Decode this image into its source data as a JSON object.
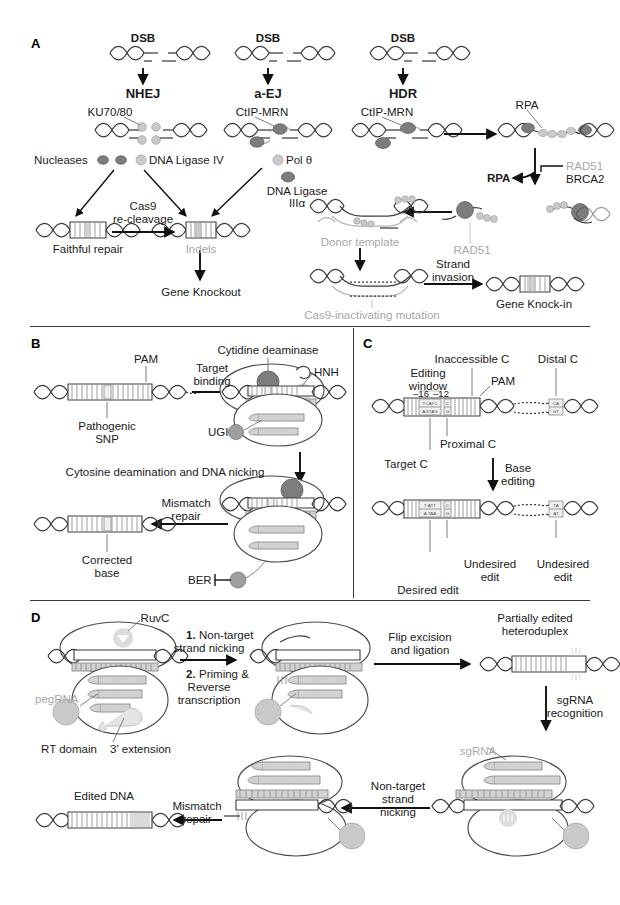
{
  "figure": {
    "type": "scientific-diagram"
  },
  "panels": [
    {
      "id": "A",
      "letter": "A",
      "title": "DNA double-strand break repair pathways",
      "labels": {
        "dsb_nhej": "DSB",
        "dsb_aej": "DSB",
        "dsb_hdr": "DSB",
        "nhej": "NHEJ",
        "aej": "a-EJ",
        "hdr": "HDR",
        "ku7080": "KU70/80",
        "ctip_mrn_aej": "CtIP-MRN",
        "ctip_mrn_hdr": "CtIP-MRN",
        "nucleases": "Nucleases",
        "dna_ligase_iv": "DNA Ligase IV",
        "pol_theta": "Pol θ",
        "dna_ligase_iii_l1": "DNA Ligase",
        "dna_ligase_iii_l2": "IIIα",
        "cas9_recleavage_l1": "Cas9",
        "cas9_recleavage_l2": "re-cleavage",
        "faithful_repair": "Faithful repair",
        "indels": "Indels",
        "gene_knockout": "Gene Knockout",
        "rpa_top": "RPA",
        "rpa_left": "RPA",
        "rad51_top": "RAD51",
        "brca2": "BRCA2",
        "rad51_bottom": "RAD51",
        "donor_template": "Donor template",
        "strand_invasion_l1": "Strand",
        "strand_invasion_l2": "invasion",
        "gene_knock_in": "Gene Knock-in",
        "cas9_inactivating": "Cas9-inactivating mutation"
      }
    },
    {
      "id": "B",
      "letter": "B",
      "title": "Cytosine base editing",
      "labels": {
        "pam": "PAM",
        "pathogenic_l1": "Pathogenic",
        "pathogenic_l2": "SNP",
        "target_binding_l1": "Target",
        "target_binding_l2": "binding",
        "cytidine_deaminase": "Cytidine deaminase",
        "hnh": "HNH",
        "ugi": "UGI",
        "deamination": "Cytosine deamination and DNA nicking",
        "mismatch_repair_l1": "Mismatch",
        "mismatch_repair_l2": "repair",
        "corrected_l1": "Corrected",
        "corrected_l2": "base",
        "ber": "BER"
      }
    },
    {
      "id": "C",
      "letter": "C",
      "title": "Base editing window and bystander edits",
      "labels": {
        "inaccessible_c": "Inaccessible C",
        "distal_c": "Distal C",
        "editing_window_l1": "Editing",
        "editing_window_l2": "window",
        "pam": "PAM",
        "pos_16": "–16",
        "pos_12": "–12",
        "proximal_c": "Proximal C",
        "target_c": "Target C",
        "base_editing_l1": "Base",
        "base_editing_l2": "editing",
        "desired_edit": "Desired edit",
        "undesired_edit_1_l1": "Undesired",
        "undesired_edit_1_l2": "edit",
        "undesired_edit_2_l1": "Undesired",
        "undesired_edit_2_l2": "edit"
      },
      "sequences": {
        "before_window_top": "TCATC",
        "before_window_bottom": "AGTAG",
        "before_proximal_top": "C",
        "before_proximal_bottom": "G",
        "before_distal_top": "CA",
        "before_distal_bottom": "GT",
        "after_window_top": "T ATT",
        "after_window_bottom": "A TAA",
        "after_proximal_top": "C",
        "after_proximal_bottom": "G",
        "after_distal_top": "TA",
        "after_distal_bottom": "AT"
      }
    },
    {
      "id": "D",
      "letter": "D",
      "title": "Prime editing mechanism",
      "labels": {
        "ruvc": "RuvC",
        "pegrna": "pegRNA",
        "rt_domain": "RT domain",
        "three_prime_extension": "3′ extension",
        "step1_num": "1.",
        "step1_l1": "Non-target",
        "step1_l2": "strand nicking",
        "step2_num": "2.",
        "step2_l1": "Priming &",
        "step2_l2": "Reverse",
        "step2_l3": "transcription",
        "flip_excision_l1": "Flip excision",
        "flip_excision_l2": "and ligation",
        "heteroduplex_l1": "Partially edited",
        "heteroduplex_l2": "heteroduplex",
        "sgrna_recognition_l1": "sgRNA",
        "sgrna_recognition_l2": "recognition",
        "sgrna": "sgRNA",
        "nontarget_nicking_l1": "Non-target",
        "nontarget_nicking_l2": "strand",
        "nontarget_nicking_l3": "nicking",
        "mismatch_repair_l1": "Mismatch",
        "mismatch_repair_l2": "repair",
        "edited_dna": "Edited DNA"
      }
    }
  ],
  "colors": {
    "ink": "#1a1a1a",
    "grey_text": "#a8a8a8",
    "dna_stroke": "#3c3c3c",
    "protein_dark": "#7d7d7d",
    "protein_mid": "#9e9e9e",
    "protein_light": "#c9c9c9",
    "rna": "#d2d2d2",
    "background": "#ffffff"
  }
}
